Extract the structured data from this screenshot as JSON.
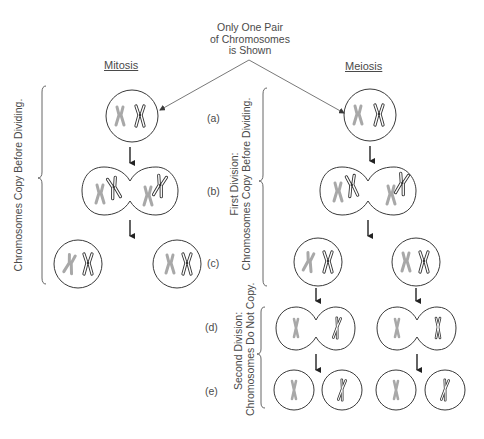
{
  "title": {
    "lines": [
      "Only One Pair",
      "of Chromosomes",
      "is Shown"
    ]
  },
  "columns": {
    "mitosis": "Mitosis",
    "meiosis": "Meiosis"
  },
  "steps": {
    "a": "(a)",
    "b": "(b)",
    "c": "(c)",
    "d": "(d)",
    "e": "(e)"
  },
  "side_labels": {
    "mitosis_copy": "Chromosomes Copy Before Dividing.",
    "first_division_line1": "First Division:",
    "first_division_line2": "Chromosomes Copy Before Dividing.",
    "second_division_line1": "Second Division:",
    "second_division_line2": "Chromosomes Do Not Copy."
  },
  "colors": {
    "outline": "#3a3a3a",
    "grey_chromosome": "#a8a8a8",
    "text": "#4a4a4a"
  }
}
